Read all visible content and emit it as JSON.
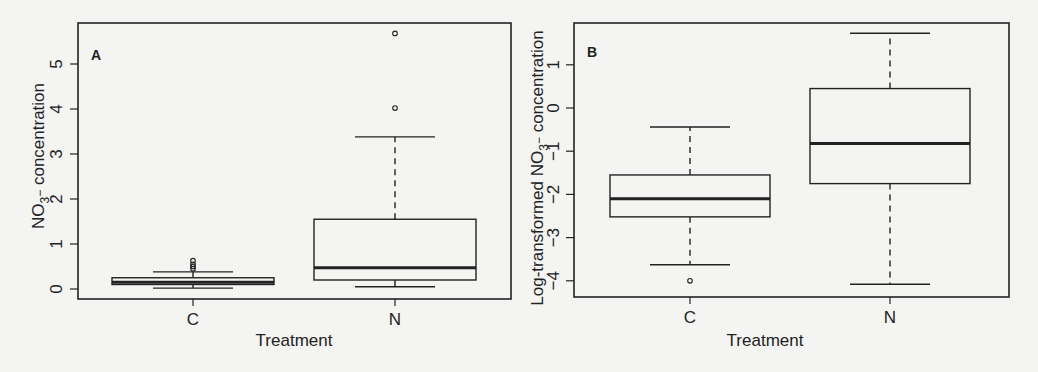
{
  "chart_data": [
    {
      "panel": "A",
      "type": "box",
      "title": "",
      "panel_label": "A",
      "xlabel": "Treatment",
      "ylabel_main": "NO",
      "ylabel_sub": "3",
      "ylabel_sup": "−",
      "ylabel_rest": " concentration",
      "ylabel": "NO3− concentration",
      "categories": [
        "C",
        "N"
      ],
      "yticks": [
        0,
        1,
        2,
        3,
        4,
        5
      ],
      "ylim": [
        -0.22,
        5.92
      ],
      "grid": false,
      "series": [
        {
          "name": "C",
          "whisker_low": 0.02,
          "q1": 0.1,
          "median": 0.15,
          "q3": 0.25,
          "whisker_high": 0.38,
          "outliers": [
            0.45,
            0.5,
            0.55,
            0.63
          ]
        },
        {
          "name": "N",
          "whisker_low": 0.05,
          "q1": 0.2,
          "median": 0.47,
          "q3": 1.55,
          "whisker_high": 3.38,
          "outliers": [
            4.02,
            5.68
          ]
        }
      ]
    },
    {
      "panel": "B",
      "type": "box",
      "title": "",
      "panel_label": "B",
      "xlabel": "Treatment",
      "ylabel_main": "Log-transformed NO",
      "ylabel_sub": "3",
      "ylabel_sup": "−",
      "ylabel_rest": " concentration",
      "ylabel": "Log-transformed NO3− concentration",
      "categories": [
        "C",
        "N"
      ],
      "yticks": [
        1,
        0,
        -1,
        -2,
        -3,
        -4
      ],
      "ylim": [
        -4.4,
        1.97
      ],
      "grid": false,
      "series": [
        {
          "name": "C",
          "whisker_low": -3.63,
          "q1": -2.52,
          "median": -2.1,
          "q3": -1.55,
          "whisker_high": -0.44,
          "outliers": [
            -4.0
          ]
        },
        {
          "name": "N",
          "whisker_low": -4.08,
          "q1": -1.75,
          "median": -0.82,
          "q3": 0.45,
          "whisker_high": 1.73,
          "outliers": []
        }
      ]
    }
  ],
  "colors": {
    "background": "#f4f4f2",
    "ink": "#222222"
  }
}
